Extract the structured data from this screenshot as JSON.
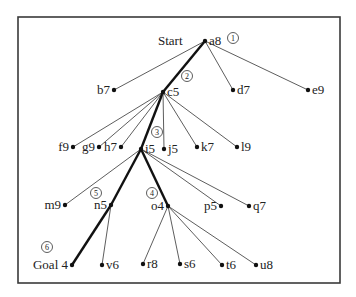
{
  "diagram": {
    "type": "search-tree",
    "start_label": "Start",
    "frame": {
      "x": 18,
      "y": 17,
      "width": 322,
      "height": 266
    },
    "nodes": [
      {
        "id": "a8",
        "label": "a8",
        "x": 205,
        "y": 41,
        "label_side": "right"
      },
      {
        "id": "b7",
        "label": "b7",
        "x": 114,
        "y": 90,
        "label_side": "left"
      },
      {
        "id": "c5",
        "label": "c5",
        "x": 163,
        "y": 92,
        "label_side": "right"
      },
      {
        "id": "d7",
        "label": "d7",
        "x": 233,
        "y": 90,
        "label_side": "right"
      },
      {
        "id": "e9",
        "label": "e9",
        "x": 308,
        "y": 90,
        "label_side": "right"
      },
      {
        "id": "f9",
        "label": "f9",
        "x": 73,
        "y": 147,
        "label_side": "left"
      },
      {
        "id": "g9",
        "label": "g9",
        "x": 99,
        "y": 147,
        "label_side": "left"
      },
      {
        "id": "h7",
        "label": "h7",
        "x": 121,
        "y": 147,
        "label_side": "left"
      },
      {
        "id": "i5",
        "label": "i5",
        "x": 141,
        "y": 149,
        "label_side": "right"
      },
      {
        "id": "j5",
        "label": "j5",
        "x": 164,
        "y": 149,
        "label_side": "right"
      },
      {
        "id": "k7",
        "label": "k7",
        "x": 197,
        "y": 147,
        "label_side": "right"
      },
      {
        "id": "l9",
        "label": "l9",
        "x": 237,
        "y": 147,
        "label_side": "right"
      },
      {
        "id": "m9",
        "label": "m9",
        "x": 65,
        "y": 205,
        "label_side": "left"
      },
      {
        "id": "n5",
        "label": "n5",
        "x": 111,
        "y": 205,
        "label_side": "left"
      },
      {
        "id": "o4",
        "label": "o4",
        "x": 168,
        "y": 206,
        "label_side": "left"
      },
      {
        "id": "p5",
        "label": "p5",
        "x": 221,
        "y": 206,
        "label_side": "left"
      },
      {
        "id": "q7",
        "label": "q7",
        "x": 249,
        "y": 206,
        "label_side": "right"
      },
      {
        "id": "goal",
        "label": "Goal 4",
        "x": 72,
        "y": 265,
        "label_side": "left"
      },
      {
        "id": "v6",
        "label": "v6",
        "x": 102,
        "y": 265,
        "label_side": "right"
      },
      {
        "id": "r8",
        "label": "r8",
        "x": 143,
        "y": 264,
        "label_side": "right"
      },
      {
        "id": "s6",
        "label": "s6",
        "x": 180,
        "y": 264,
        "label_side": "right"
      },
      {
        "id": "t6",
        "label": "t6",
        "x": 222,
        "y": 265,
        "label_side": "right"
      },
      {
        "id": "u8",
        "label": "u8",
        "x": 256,
        "y": 265,
        "label_side": "right"
      }
    ],
    "edges": [
      {
        "from": "a8",
        "to": "b7",
        "bold": false
      },
      {
        "from": "a8",
        "to": "c5",
        "bold": true
      },
      {
        "from": "a8",
        "to": "d7",
        "bold": false
      },
      {
        "from": "a8",
        "to": "e9",
        "bold": false
      },
      {
        "from": "c5",
        "to": "f9",
        "bold": false
      },
      {
        "from": "c5",
        "to": "g9",
        "bold": false
      },
      {
        "from": "c5",
        "to": "h7",
        "bold": false
      },
      {
        "from": "c5",
        "to": "i5",
        "bold": true
      },
      {
        "from": "c5",
        "to": "j5",
        "bold": false
      },
      {
        "from": "c5",
        "to": "k7",
        "bold": false
      },
      {
        "from": "c5",
        "to": "l9",
        "bold": false
      },
      {
        "from": "i5",
        "to": "m9",
        "bold": false
      },
      {
        "from": "i5",
        "to": "n5",
        "bold": true
      },
      {
        "from": "i5",
        "to": "o4",
        "bold": true
      },
      {
        "from": "i5",
        "to": "p5",
        "bold": false
      },
      {
        "from": "i5",
        "to": "q7",
        "bold": false
      },
      {
        "from": "n5",
        "to": "goal",
        "bold": true
      },
      {
        "from": "n5",
        "to": "v6",
        "bold": false
      },
      {
        "from": "o4",
        "to": "r8",
        "bold": false
      },
      {
        "from": "o4",
        "to": "s6",
        "bold": false
      },
      {
        "from": "o4",
        "to": "t6",
        "bold": false
      },
      {
        "from": "o4",
        "to": "u8",
        "bold": false
      }
    ],
    "step_markers": [
      {
        "number": "1",
        "x": 233,
        "y": 38
      },
      {
        "number": "2",
        "x": 187,
        "y": 76
      },
      {
        "number": "3",
        "x": 157,
        "y": 132
      },
      {
        "number": "4",
        "x": 152,
        "y": 193
      },
      {
        "number": "5",
        "x": 96,
        "y": 193
      },
      {
        "number": "6",
        "x": 47,
        "y": 247
      }
    ]
  }
}
